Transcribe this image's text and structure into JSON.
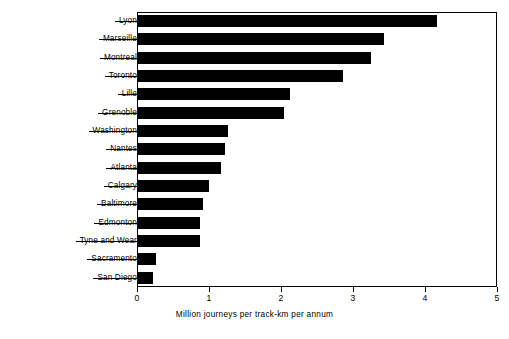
{
  "chart_data": {
    "type": "bar",
    "orientation": "horizontal",
    "title": "",
    "xlabel": "Million journeys per track-km per annum",
    "ylabel": "",
    "xlim": [
      0,
      5
    ],
    "xticks": [
      0,
      1,
      2,
      3,
      4,
      5
    ],
    "xticklabels": [
      "0",
      "1",
      "2",
      "3",
      "4",
      "5"
    ],
    "grid": false,
    "legend": null,
    "bar_color": "#000000",
    "background_color": "#ffffff",
    "categories": [
      "Lyon",
      "Marseille",
      "Montreal",
      "Toronto",
      "Lille",
      "Grenoble",
      "Washington",
      "Nantes",
      "Atlanta",
      "Calgary",
      "Baltimore",
      "Edmonton",
      "Tyne and Wear",
      "Sacramento",
      "San Diego"
    ],
    "values": [
      4.17,
      3.43,
      3.25,
      2.86,
      2.12,
      2.04,
      1.27,
      1.22,
      1.16,
      1.0,
      0.91,
      0.87,
      0.88,
      0.26,
      0.22
    ]
  }
}
